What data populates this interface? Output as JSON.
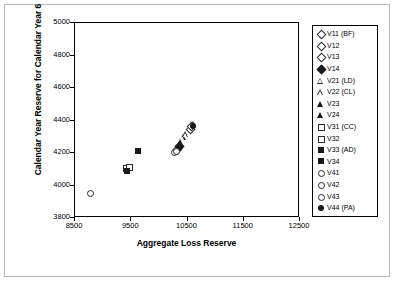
{
  "chart_data": {
    "type": "scatter",
    "title": "",
    "xlabel": "Aggregate Loss Reserve",
    "ylabel": "Calendar Year Reserve for Calendar Year 6",
    "xlim": [
      8500,
      12500
    ],
    "ylim": [
      3800,
      5000
    ],
    "xticks": [
      "8500",
      "9500",
      "10500",
      "11500",
      "12500"
    ],
    "yticks": [
      "5000",
      "4800",
      "4600",
      "4400",
      "4200",
      "4000",
      "3800"
    ],
    "grid": false,
    "legend_position": "right",
    "series": [
      {
        "name": "V11 (BF)",
        "marker": "diamond-open",
        "x": 10540,
        "y": 4350
      },
      {
        "name": "V12",
        "marker": "diamond-open",
        "x": 10560,
        "y": 4370
      },
      {
        "name": "V13",
        "marker": "diamond-open",
        "x": 10310,
        "y": 4225
      },
      {
        "name": "V14",
        "marker": "diamond-filled",
        "x": 10340,
        "y": 4245
      },
      {
        "name": "V21 (LD)",
        "marker": "tri-open",
        "x": 10420,
        "y": 4300
      },
      {
        "name": "V22 (CL)",
        "marker": "tri-open",
        "x": 10470,
        "y": 4320
      },
      {
        "name": "V23",
        "marker": "tri-filled",
        "x": 10380,
        "y": 4270
      },
      {
        "name": "V24",
        "marker": "tri-filled",
        "x": 10600,
        "y": 4380
      },
      {
        "name": "V31 (CC)",
        "marker": "square-open",
        "x": 9400,
        "y": 4110
      },
      {
        "name": "V32",
        "marker": "square-open",
        "x": 9450,
        "y": 4120
      },
      {
        "name": "V33 (AD)",
        "marker": "square-filled",
        "x": 9430,
        "y": 4090
      },
      {
        "name": "V34",
        "marker": "square-filled",
        "x": 9620,
        "y": 4215
      },
      {
        "name": "V41",
        "marker": "circle-open",
        "x": 8760,
        "y": 3955
      },
      {
        "name": "V42",
        "marker": "circle-open",
        "x": 10250,
        "y": 4210
      },
      {
        "name": "V43",
        "marker": "circle-open",
        "x": 10280,
        "y": 4215
      },
      {
        "name": "V44 (PA)",
        "marker": "circle-filled",
        "x": 10590,
        "y": 4365
      }
    ]
  }
}
